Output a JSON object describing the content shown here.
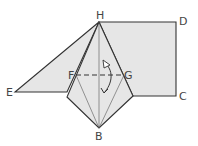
{
  "diagram": {
    "type": "origami-fold-step",
    "colors": {
      "paper_fill": "#e6e6e6",
      "line": "#333333",
      "thin_line": "#555555",
      "label": "#444444",
      "background": "#ffffff"
    },
    "points": {
      "H": {
        "label": "H",
        "x": 99,
        "y": 22
      },
      "D": {
        "label": "D",
        "x": 176,
        "y": 22
      },
      "C": {
        "label": "C",
        "x": 176,
        "y": 96
      },
      "E": {
        "label": "E",
        "x": 15,
        "y": 92
      },
      "F": {
        "label": "F",
        "x": 76,
        "y": 75
      },
      "G": {
        "label": "G",
        "x": 124,
        "y": 75
      },
      "B": {
        "label": "B",
        "x": 99,
        "y": 128
      }
    },
    "labels": {
      "H": "H",
      "D": "D",
      "C": "C",
      "E": "E",
      "F": "F",
      "G": "G",
      "B": "B"
    },
    "annotations": {
      "fold_line": "dashed valley fold F–G",
      "arrow": "fold direction arrow (up and back down)"
    }
  }
}
